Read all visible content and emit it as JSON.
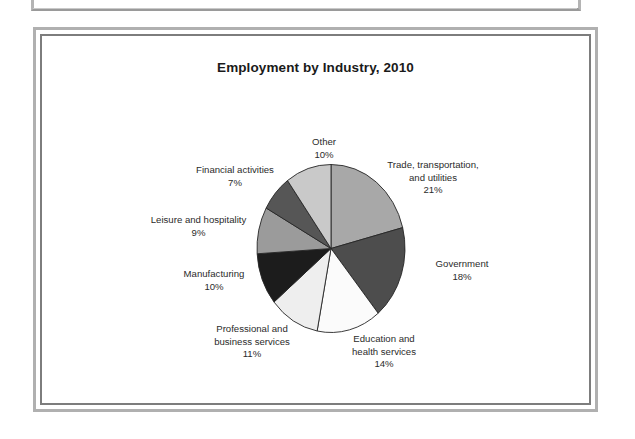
{
  "page": {
    "background_color": "#ffffff",
    "frame_outer_color": "#b0b0b0",
    "frame_inner_color": "#7d7d7d"
  },
  "chart_data": {
    "type": "pie",
    "title": "Employment by Industry, 2010",
    "xlabel": "",
    "ylabel": "",
    "legend_position": "none (direct slice labels)",
    "grid": false,
    "start_angle_deg": 0,
    "direction": "clockwise",
    "units": "percent of total employment",
    "categories": [
      "Trade, transportation, and utilities",
      "Government",
      "Education and health services",
      "Professional and business services",
      "Manufacturing",
      "Leisure and hospitality",
      "Financial activities",
      "Other"
    ],
    "values": [
      21,
      18,
      14,
      11,
      10,
      9,
      7,
      10
    ],
    "slices": [
      {
        "key": "trade",
        "name": "Trade, transportation,",
        "name_line2": "and utilities",
        "value": 21,
        "value_label": "21%",
        "color": "#a8a8a8"
      },
      {
        "key": "government",
        "name": "Government",
        "name_line2": "",
        "value": 18,
        "value_label": "18%",
        "color": "#4d4d4d"
      },
      {
        "key": "education",
        "name": "Education and",
        "name_line2": "health services",
        "value": 14,
        "value_label": "14%",
        "color": "#fbfbfb"
      },
      {
        "key": "professional",
        "name": "Professional and",
        "name_line2": "business services",
        "value": 11,
        "value_label": "11%",
        "color": "#eeeeee"
      },
      {
        "key": "manufacturing",
        "name": "Manufacturing",
        "name_line2": "",
        "value": 10,
        "value_label": "10%",
        "color": "#1c1c1c"
      },
      {
        "key": "leisure",
        "name": "Leisure and hospitality",
        "name_line2": "",
        "value": 9,
        "value_label": "9%",
        "color": "#9b9b9b"
      },
      {
        "key": "financial",
        "name": "Financial activities",
        "name_line2": "",
        "value": 7,
        "value_label": "7%",
        "color": "#565656"
      },
      {
        "key": "other",
        "name": "Other",
        "name_line2": "",
        "value": 10,
        "value_label": "10%",
        "color": "#c9c9c9"
      }
    ]
  }
}
